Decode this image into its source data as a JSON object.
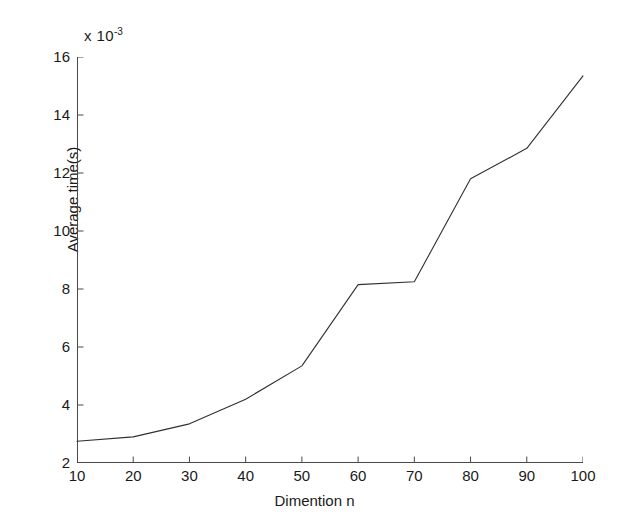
{
  "chart_data": {
    "type": "line",
    "title": "",
    "subtitle": "",
    "xlabel": "Dimention n",
    "ylabel": "Average time(s)",
    "y_multiplier_label": "x 10",
    "y_multiplier_exponent": "-3",
    "y_multiplier": 0.001,
    "x": [
      10,
      20,
      30,
      40,
      50,
      60,
      70,
      80,
      90,
      100
    ],
    "categories": [
      "10",
      "20",
      "30",
      "40",
      "50",
      "60",
      "70",
      "80",
      "90",
      "100"
    ],
    "series": [
      {
        "name": "Average time",
        "values": [
          2.75,
          2.9,
          3.35,
          4.2,
          5.35,
          8.15,
          8.25,
          11.8,
          12.85,
          15.35
        ],
        "color": "#303030",
        "line_width": 1.1,
        "marker": "none"
      }
    ],
    "xlim": [
      10,
      100
    ],
    "ylim": [
      2,
      16
    ],
    "xticks": [
      10,
      20,
      30,
      40,
      50,
      60,
      70,
      80,
      90,
      100
    ],
    "yticks": [
      2,
      4,
      6,
      8,
      10,
      12,
      14,
      16
    ],
    "xtick_labels": [
      "10",
      "20",
      "30",
      "40",
      "50",
      "60",
      "70",
      "80",
      "90",
      "100"
    ],
    "ytick_labels": [
      "2",
      "4",
      "6",
      "8",
      "10",
      "12",
      "14",
      "16"
    ],
    "grid": false,
    "legend": false,
    "legend_position": "none",
    "background_color": "#ffffff",
    "axis_color": "#4a4a4a",
    "text_color": "#1a1a1a",
    "tick_direction": "in",
    "box": false,
    "annotations": []
  }
}
